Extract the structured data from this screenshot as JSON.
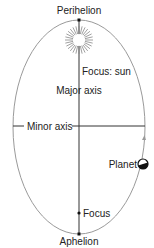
{
  "labels": {
    "perihelion": "Perihelion",
    "focus_sun": "Focus: sun",
    "major_axis": "Major axis",
    "minor_axis": "Minor axis",
    "planet": "Planet",
    "focus": "Focus",
    "aphelion": "Aphelion"
  },
  "colors": {
    "orbit": "#9a9a9a",
    "axis": "#333333",
    "text": "#222222",
    "sun_rays": "#888888"
  }
}
